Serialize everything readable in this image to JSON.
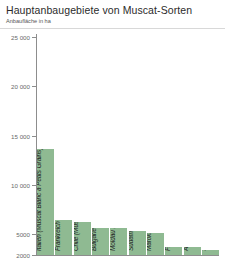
{
  "header": {
    "title": "Hauptanbaugebiete von Muscat-Sorten",
    "subtitle": "Anbaufläche in ha"
  },
  "chart_data": {
    "type": "bar",
    "title": "Hauptanbaugebiete von Muscat-Sorten",
    "subtitle": "Anbaufläche in ha",
    "xlabel": "",
    "ylabel": "Anbaufläche in ha",
    "ylim": [
      0,
      25000
    ],
    "grid": false,
    "legend": null,
    "orientation": "vertical",
    "value_unit": "ha",
    "ytick_labels": [
      "25 000",
      "20 000",
      "15 000",
      "10 000",
      "5000",
      "2000"
    ],
    "ytick_values": [
      25000,
      20000,
      15000,
      10000,
      5000,
      2000
    ],
    "categories": [
      "Italien",
      "Frankreich",
      "Chile",
      "Bulgarien",
      "Moldau",
      "Südafrika",
      "Marokko",
      "Frankreich",
      "Australien",
      "Spanien"
    ],
    "values": [
      13533,
      6349,
      6087,
      5540,
      5500,
      5179,
      5000,
      3007,
      3005,
      2543
    ],
    "bars": [
      {
        "label": "Italien (Muscat Blanc à Petits Grains) 13 533",
        "country": "Italien",
        "variety": "Muscat Blanc à Petits Grains",
        "value": 13533
      },
      {
        "label": "Frankreich (Muscat Blanc à Petits Grains) 6349",
        "country": "Frankreich",
        "variety": "Muscat Blanc à Petits Grains",
        "value": 6349
      },
      {
        "label": "Chile (Muscat of Alexandria) 6087",
        "country": "Chile",
        "variety": "Muscat of Alexandria",
        "value": 6087
      },
      {
        "label": "Bulgarien (Muscat Ottonel) 5540 (geschätzt)",
        "country": "Bulgarien",
        "variety": "Muscat Ottonel",
        "value": 5540
      },
      {
        "label": "Moldau (Muscat Ottonel, Muscat jantarnij) 5500",
        "country": "Moldau",
        "variety": "Muscat Ottonel, Muscat jantarnij",
        "value": 5500
      },
      {
        "label": "Südafrika (Muscat of Alexandria) 5179",
        "country": "Südafrika",
        "variety": "Muscat of Alexandria",
        "value": 5179
      },
      {
        "label": "Marokko (Muscat of Alexandria) 5000",
        "country": "Marokko",
        "variety": "Muscat of Alexandria",
        "value": 5000
      },
      {
        "label": "Frankreich (Muscat of Alexandria) 3007",
        "country": "Frankreich",
        "variety": "Muscat of Alexandria",
        "value": 3007
      },
      {
        "label": "Australien (Muscat of Alexandria) 3005",
        "country": "Australien",
        "variety": "Muscat of Alexandria",
        "value": 3005
      },
      {
        "label": "Spanien (Muscat of Alexandria) 2543",
        "country": "Spanien",
        "variety": "Muscat of Alexandria",
        "value": 2543
      }
    ],
    "colors": {
      "bar": "#8fba92",
      "axis": "#8d8d8d",
      "tick_label": "#6a6a6a",
      "bar_label": "#1d1d1d",
      "background": "#ffffff",
      "rule": "#d8d8d8"
    }
  }
}
